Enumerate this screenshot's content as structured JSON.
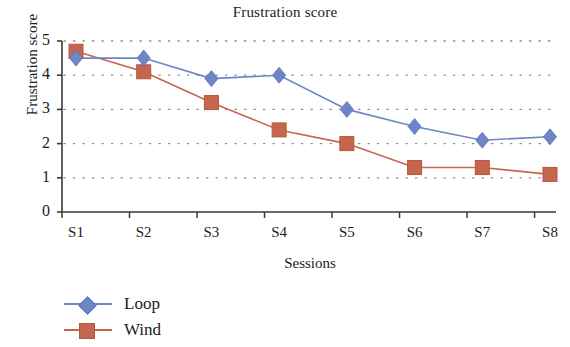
{
  "chart_data": {
    "type": "line",
    "title": "Frustration score",
    "xlabel": "Sessions",
    "ylabel": "Frustration score",
    "categories": [
      "S1",
      "S2",
      "S3",
      "S4",
      "S5",
      "S6",
      "S7",
      "S8"
    ],
    "ylim": [
      0,
      5
    ],
    "yticks": [
      "0",
      "1",
      "2",
      "3",
      "4",
      "5"
    ],
    "grid": "horizontal-dotted",
    "legend_position": "bottom-left",
    "series": [
      {
        "name": "Loop",
        "color": "#6f86c6",
        "marker": "diamond",
        "values": [
          4.5,
          4.5,
          3.9,
          4.0,
          3.0,
          2.5,
          2.1,
          2.2
        ]
      },
      {
        "name": "Wind",
        "color": "#c4674e",
        "marker": "square",
        "values": [
          4.7,
          4.1,
          3.2,
          2.4,
          2.0,
          1.3,
          1.3,
          1.1
        ]
      }
    ]
  }
}
